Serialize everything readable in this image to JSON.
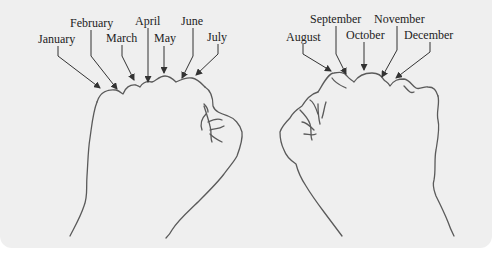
{
  "diagram": {
    "type": "knuckle-mnemonic",
    "colors": {
      "background": "#efefef",
      "line": "#5a5a5a",
      "text": "#222222"
    },
    "left_fist": {
      "labels": [
        {
          "month": "January",
          "x": 38,
          "y": 32
        },
        {
          "month": "February",
          "x": 70,
          "y": 16
        },
        {
          "month": "March",
          "x": 106,
          "y": 31
        },
        {
          "month": "April",
          "x": 136,
          "y": 14
        },
        {
          "month": "May",
          "x": 154,
          "y": 31
        },
        {
          "month": "June",
          "x": 181,
          "y": 14
        },
        {
          "month": "July",
          "x": 207,
          "y": 30
        }
      ]
    },
    "right_fist": {
      "labels": [
        {
          "month": "August",
          "x": 287,
          "y": 30
        },
        {
          "month": "September",
          "x": 310,
          "y": 12
        },
        {
          "month": "October",
          "x": 346,
          "y": 28
        },
        {
          "month": "November",
          "x": 374,
          "y": 12
        },
        {
          "month": "December",
          "x": 404,
          "y": 28
        }
      ]
    }
  }
}
